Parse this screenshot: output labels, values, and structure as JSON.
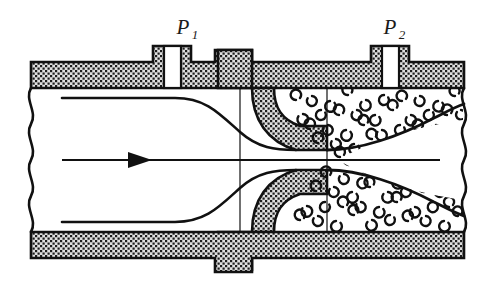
{
  "figure": {
    "type": "engineering-cross-section-diagram",
    "background_color": "#ffffff",
    "line_color": "#111111",
    "wall_fill_color": "#d8d8d8",
    "wall_stipple_color": "#1a1a1a",
    "canvas": {
      "width": 495,
      "height": 285
    }
  },
  "labels": {
    "upstream_pressure": {
      "symbol": "P",
      "subscript": "1",
      "x": 185,
      "y": 30
    },
    "downstream_pressure": {
      "symbol": "P",
      "subscript": "2",
      "x": 392,
      "y": 30
    }
  },
  "annotations": {
    "flow_arrow_name": "flow-direction-arrow",
    "flow_direction": "left-to-right",
    "centerline_name": "pipe-centerline",
    "break_line_left": "wavy-break-left",
    "break_line_right": "wavy-break-right",
    "eddy_symbol": "turbulent-eddy-crescent",
    "eddy_count_top": 46,
    "eddy_count_bottom": 40
  },
  "geometry": {
    "pipe_left_x": 30,
    "pipe_right_x": 465,
    "wall_outer_top_y": 62,
    "wall_inner_top_y": 88,
    "wall_inner_bottom_y": 232,
    "wall_outer_bottom_y": 258,
    "centerline_y": 160,
    "throat_x": 327,
    "vena_contracta_x": 240,
    "tap1_center_x": 172,
    "tap2_center_x": 390,
    "tap_bore_width": 16,
    "boss_top_y": 46
  },
  "parts": [
    {
      "name": "pipe-wall-upper",
      "interactable": false
    },
    {
      "name": "pipe-wall-lower",
      "interactable": false
    },
    {
      "name": "nozzle-body-upper",
      "interactable": false
    },
    {
      "name": "nozzle-body-lower",
      "interactable": false
    },
    {
      "name": "pressure-tap-upstream",
      "interactable": false
    },
    {
      "name": "pressure-tap-downstream",
      "interactable": false
    },
    {
      "name": "streamline-upper",
      "interactable": false
    },
    {
      "name": "streamline-lower",
      "interactable": false
    },
    {
      "name": "jet-boundary-upper",
      "interactable": false
    },
    {
      "name": "jet-boundary-lower",
      "interactable": false
    },
    {
      "name": "recirculation-zone-upper",
      "interactable": false
    },
    {
      "name": "recirculation-zone-lower",
      "interactable": false
    }
  ]
}
